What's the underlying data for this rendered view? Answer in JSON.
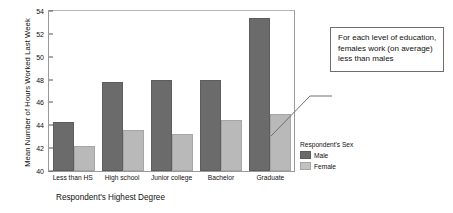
{
  "chart_data": {
    "type": "bar",
    "title": "",
    "xlabel": "Respondent's Highest Degree",
    "ylabel": "Mean Number of Hours Worked Last Week",
    "categories": [
      "Less than HS",
      "High school",
      "Junior college",
      "Bachelor",
      "Graduate"
    ],
    "series": [
      {
        "name": "Male",
        "color": "#6b6b6b",
        "values": [
          44.3,
          47.8,
          48.0,
          48.0,
          53.4
        ]
      },
      {
        "name": "Female",
        "color": "#b9b9b9",
        "values": [
          42.2,
          43.6,
          43.2,
          44.5,
          45.0
        ]
      }
    ],
    "ylim": [
      40,
      54
    ],
    "yticks": [
      40,
      42,
      44,
      46,
      48,
      50,
      52,
      54
    ],
    "grid": false,
    "legend_position": "right-bottom"
  },
  "legend": {
    "title": "Respondent's Sex",
    "items": [
      {
        "label": "Male"
      },
      {
        "label": "Female"
      }
    ]
  },
  "annotation": {
    "text": "For each level of education, females work (on average) less than males"
  }
}
